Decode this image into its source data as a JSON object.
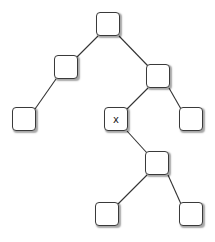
{
  "diagram": {
    "type": "binary-tree",
    "nodes": [
      {
        "id": "root",
        "label": "",
        "x": 96,
        "y": 12
      },
      {
        "id": "l",
        "label": "",
        "x": 54,
        "y": 55
      },
      {
        "id": "r",
        "label": "",
        "x": 146,
        "y": 64
      },
      {
        "id": "ll",
        "label": "",
        "x": 12,
        "y": 107
      },
      {
        "id": "rl",
        "label": "x",
        "x": 104,
        "y": 107
      },
      {
        "id": "rr",
        "label": "",
        "x": 179,
        "y": 107
      },
      {
        "id": "rlr",
        "label": "",
        "x": 145,
        "y": 151
      },
      {
        "id": "rlrl",
        "label": "",
        "x": 95,
        "y": 202
      },
      {
        "id": "rlrr",
        "label": "",
        "x": 179,
        "y": 202
      }
    ],
    "edges": [
      [
        "root",
        "l"
      ],
      [
        "root",
        "r"
      ],
      [
        "l",
        "ll"
      ],
      [
        "r",
        "rl"
      ],
      [
        "r",
        "rr"
      ],
      [
        "rl",
        "rlr"
      ],
      [
        "rlr",
        "rlrl"
      ],
      [
        "rlr",
        "rlrr"
      ]
    ]
  }
}
